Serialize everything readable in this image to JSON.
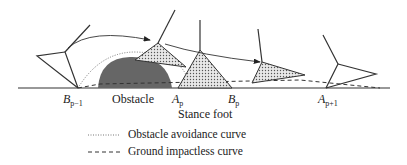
{
  "labels": {
    "b_prev": {
      "base": "B",
      "sub": "p−1"
    },
    "obstacle": "Obstacle",
    "a_p": {
      "base": "A",
      "sub": "p"
    },
    "b_p": {
      "base": "B",
      "sub": "p"
    },
    "a_next": {
      "base": "A",
      "sub": "p+1"
    },
    "stance_foot": "Stance foot"
  },
  "legend": [
    {
      "style": "dotted",
      "label": "Obstacle avoidance curve"
    },
    {
      "style": "dashed",
      "label": "Ground impactless curve"
    }
  ],
  "colors": {
    "line": "#333333",
    "obstacle": "#666666",
    "foot_fill": "#bbbbbb"
  }
}
